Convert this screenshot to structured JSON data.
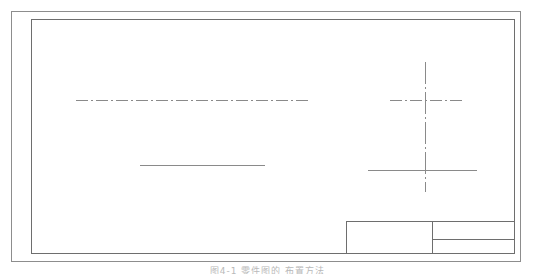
{
  "document": {
    "type": "engineering-drawing",
    "sheet_format": "bordered drawing sheet with double frame and title block",
    "caption": "图4-1 零件图的 布置方法"
  },
  "sheet": {
    "outer_border_label": "outer sheet border",
    "inner_border_label": "inner drawing frame"
  },
  "geometry": {
    "items": [
      {
        "name": "upper-left-centerline",
        "kind": "centerline-horizontal",
        "x1": 76,
        "y": 100,
        "x2": 310
      },
      {
        "name": "lower-left-outline",
        "kind": "solid-horizontal",
        "x1": 140,
        "y": 165,
        "x2": 265
      },
      {
        "name": "right-view-horizontal-centerline",
        "kind": "centerline-horizontal",
        "x1": 390,
        "y": 100,
        "x2": 462
      },
      {
        "name": "right-view-vertical-centerline",
        "kind": "centerline-vertical",
        "x": 425,
        "y1": 62,
        "y2": 192
      },
      {
        "name": "right-view-baseline",
        "kind": "solid-horizontal",
        "x1": 368,
        "y": 170,
        "x2": 477
      }
    ]
  },
  "title_block": {
    "label": "title block",
    "cells": [
      {
        "name": "title-block-left-cell",
        "text": ""
      },
      {
        "name": "title-block-right-upper-cell",
        "text": ""
      },
      {
        "name": "title-block-right-lower-cell",
        "text": ""
      }
    ]
  },
  "colors": {
    "line": "#8a8a8a",
    "frame": "#6e6e6e",
    "outer_frame": "#8d8d8d",
    "caption": "#b9b9b9",
    "background": "#ffffff"
  }
}
